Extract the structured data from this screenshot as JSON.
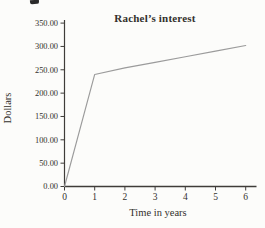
{
  "page": {
    "background_color": "#fcfcfa",
    "artifacts": {
      "top_left_fragment": "cropped-print-ink-mark"
    }
  },
  "chart_data": {
    "type": "line",
    "title": "Rachel’s interest",
    "xlabel": "Time in years",
    "ylabel": "Dollars",
    "x": [
      0,
      1,
      2,
      3,
      4,
      5,
      6
    ],
    "y": [
      0,
      240,
      254,
      266,
      278,
      290,
      302
    ],
    "xlim": [
      0,
      6.4
    ],
    "ylim": [
      0,
      350
    ],
    "xtick_values": [
      0,
      1,
      2,
      3,
      4,
      5,
      6
    ],
    "xtick_labels": [
      "0",
      "1",
      "2",
      "3",
      "4",
      "5",
      "6"
    ],
    "ytick_values": [
      0,
      50,
      100,
      150,
      200,
      250,
      300,
      350
    ],
    "ytick_labels": [
      "0.00",
      "50.00",
      "100.00",
      "150.00",
      "200.00",
      "250.00",
      "300.00",
      "350.00"
    ],
    "grid": false,
    "legend": false,
    "line_color": "#9b9b9b",
    "axis_color": "#3f3c39",
    "text_color": "#33302c"
  }
}
